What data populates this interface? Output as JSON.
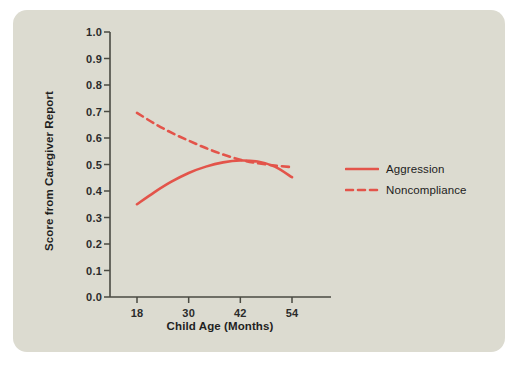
{
  "figure": {
    "panel_bg": "#dcdbd0",
    "page_bg": "#ffffff",
    "axis_color": "#4a4a42",
    "text_color": "#1f1f1f"
  },
  "chart_data": {
    "type": "line",
    "title": "",
    "xlabel": "Child Age (Months)",
    "ylabel": "Score from Caregiver Report",
    "xlim": [
      14,
      60
    ],
    "ylim": [
      0.0,
      1.0
    ],
    "xticks": [
      18,
      30,
      42,
      54
    ],
    "yticks": [
      "0.0",
      "0.1",
      "0.2",
      "0.3",
      "0.4",
      "0.5",
      "0.6",
      "0.7",
      "0.8",
      "0.9",
      "1.0"
    ],
    "grid": false,
    "legend_position": "right",
    "series_color": "#e3544a",
    "series": [
      {
        "name": "Aggression",
        "style": "solid",
        "color": "#e3544a",
        "x": [
          18,
          22,
          26,
          30,
          34,
          38,
          42,
          46,
          50,
          54
        ],
        "y": [
          0.35,
          0.395,
          0.435,
          0.468,
          0.492,
          0.508,
          0.515,
          0.511,
          0.492,
          0.452
        ]
      },
      {
        "name": "Noncompliance",
        "style": "dashed",
        "color": "#e3544a",
        "x": [
          18,
          22,
          26,
          30,
          34,
          38,
          42,
          46,
          50,
          54
        ],
        "y": [
          0.695,
          0.655,
          0.62,
          0.59,
          0.562,
          0.538,
          0.518,
          0.505,
          0.496,
          0.49
        ]
      }
    ],
    "annotations": []
  },
  "legend": {
    "items": [
      {
        "label": "Aggression",
        "style": "solid"
      },
      {
        "label": "Noncompliance",
        "style": "dashed"
      }
    ]
  }
}
